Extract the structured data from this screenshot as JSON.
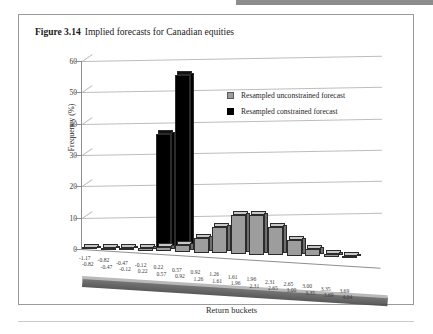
{
  "figure": {
    "label": "Figure 3.14",
    "caption": "Implied forecasts for Canadian equities"
  },
  "legend": {
    "items": [
      {
        "name": "Resampled unconstrained forecast",
        "color": "#9d9d9d"
      },
      {
        "name": "Resampled constrained forecast",
        "color": "#000000"
      }
    ]
  },
  "chart_data": {
    "type": "bar",
    "title": "Implied forecasts for Canadian equities",
    "xlabel": "Return buckets",
    "ylabel": "Frequency (%)",
    "ylim": [
      0,
      60
    ],
    "yticks": [
      0,
      10,
      20,
      30,
      40,
      50,
      60
    ],
    "grid": true,
    "legend_position": "upper-right-inside",
    "categories": [
      "-1.17 / -0.82",
      "-0.82 / -0.47",
      "-0.47 / -0.12",
      "-0.12 / 0.22",
      "0.22 / 0.57",
      "0.57 / 0.92",
      "0.92 / 1.26",
      "1.26 / 1.61",
      "1.61 / 1.96",
      "1.96 / 2.31",
      "2.31 / 2.65",
      "2.65 / 3.00",
      "3.00 / 3.35",
      "3.35 / 3.69",
      "3.69 / 4.04"
    ],
    "category_lines": [
      [
        "-1.17",
        "-0.82"
      ],
      [
        "-0.82",
        "-0.47"
      ],
      [
        "-0.47",
        "-0.12"
      ],
      [
        "-0.12",
        "0.22"
      ],
      [
        "0.22",
        "0.57"
      ],
      [
        "0.57",
        "0.92"
      ],
      [
        "0.92",
        "1.26"
      ],
      [
        "1.26",
        "1.61"
      ],
      [
        "1.61",
        "1.96"
      ],
      [
        "1.96",
        "2.31"
      ],
      [
        "2.31",
        "2.65"
      ],
      [
        "2.65",
        "3.00"
      ],
      [
        "3.00",
        "3.35"
      ],
      [
        "3.35",
        "3.69"
      ],
      [
        "3.69",
        "4.04"
      ]
    ],
    "series": [
      {
        "name": "Resampled unconstrained forecast",
        "color": "#9d9d9d",
        "values": [
          0.4,
          0.5,
          0.7,
          1.0,
          1.4,
          2.2,
          4.6,
          8.4,
          12.4,
          12.5,
          9.0,
          5.2,
          2.4,
          1.0,
          0.4
        ]
      },
      {
        "name": "Resampled constrained forecast",
        "color": "#000000",
        "values": [
          0,
          0,
          0,
          0,
          37.5,
          56.5,
          0,
          0,
          0,
          0,
          0,
          0,
          0,
          0,
          0
        ]
      }
    ]
  }
}
